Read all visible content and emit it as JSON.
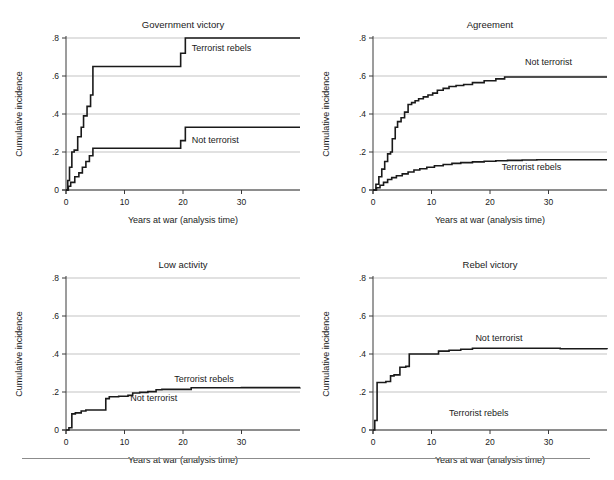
{
  "figure": {
    "background_color": "#ffffff",
    "line_color": "#1a1a1a",
    "grid_color": "#9a9a9a",
    "footer_rule": true
  },
  "chart_data": [
    {
      "type": "line",
      "title": "Government victory",
      "xlabel": "Years at war (analysis time)",
      "ylabel": "Cumulative incidence",
      "xlim": [
        0,
        40
      ],
      "ylim": [
        0,
        0.8
      ],
      "xticks": [
        0,
        10,
        20,
        30
      ],
      "xticklabels": [
        "0",
        "10",
        "20",
        "30"
      ],
      "yticks": [
        0,
        0.2,
        0.4,
        0.6,
        0.8
      ],
      "yticklabels": [
        "0",
        ".2",
        ".4",
        ".6",
        ".8"
      ],
      "grid": true,
      "step": true,
      "legend_position": "inline-annotations",
      "series": [
        {
          "name": "Terrorist rebels",
          "label_x": 21.5,
          "label_y": 0.73,
          "x": [
            0,
            0.3,
            0.6,
            1.0,
            1.4,
            2.0,
            2.6,
            3.0,
            3.6,
            4.2,
            4.6,
            18.6,
            19.6,
            20.4,
            40
          ],
          "y": [
            0,
            0.05,
            0.12,
            0.2,
            0.21,
            0.28,
            0.33,
            0.39,
            0.44,
            0.5,
            0.65,
            0.65,
            0.72,
            0.8,
            0.8
          ]
        },
        {
          "name": "Not terrorist",
          "label_x": 21.5,
          "label_y": 0.25,
          "x": [
            0,
            0.4,
            0.8,
            1.5,
            2.2,
            2.8,
            3.4,
            4.0,
            4.6,
            18.6,
            19.6,
            20.4,
            40
          ],
          "y": [
            0,
            0.02,
            0.04,
            0.07,
            0.09,
            0.12,
            0.15,
            0.18,
            0.22,
            0.22,
            0.26,
            0.33,
            0.33
          ]
        }
      ]
    },
    {
      "type": "line",
      "title": "Agreement",
      "xlabel": "Years at war (analysis time)",
      "ylabel": "Cumulative incidence",
      "xlim": [
        0,
        40
      ],
      "ylim": [
        0,
        0.8
      ],
      "xticks": [
        0,
        10,
        20,
        30
      ],
      "xticklabels": [
        "0",
        "10",
        "20",
        "30"
      ],
      "yticks": [
        0,
        0.2,
        0.4,
        0.6,
        0.8
      ],
      "yticklabels": [
        "0",
        ".2",
        ".4",
        ".6",
        ".8"
      ],
      "grid": true,
      "step": true,
      "legend_position": "inline-annotations",
      "series": [
        {
          "name": "Not terrorist",
          "label_x": 26.0,
          "label_y": 0.66,
          "x": [
            0,
            0.5,
            1.0,
            1.5,
            2.0,
            2.5,
            3.0,
            3.3,
            3.8,
            4.2,
            4.8,
            5.4,
            6.0,
            6.6,
            7.2,
            7.8,
            8.6,
            9.4,
            10.2,
            11.0,
            12.0,
            13.0,
            14.2,
            15.5,
            17.0,
            19.0,
            21.0,
            22.5,
            40
          ],
          "y": [
            0,
            0.03,
            0.07,
            0.11,
            0.15,
            0.19,
            0.2,
            0.27,
            0.33,
            0.36,
            0.38,
            0.41,
            0.45,
            0.46,
            0.47,
            0.48,
            0.49,
            0.5,
            0.51,
            0.525,
            0.535,
            0.545,
            0.55,
            0.555,
            0.565,
            0.575,
            0.585,
            0.595,
            0.595
          ]
        },
        {
          "name": "Terrorist rebels",
          "label_x": 22.0,
          "label_y": 0.105,
          "x": [
            0,
            0.6,
            1.2,
            1.8,
            2.5,
            3.2,
            4.0,
            5.0,
            6.0,
            7.0,
            8.0,
            9.2,
            10.5,
            12.0,
            13.5,
            15.0,
            17.0,
            19.0,
            21.0,
            23.0,
            25.5,
            28.0,
            40
          ],
          "y": [
            0,
            0.012,
            0.025,
            0.04,
            0.055,
            0.065,
            0.075,
            0.085,
            0.095,
            0.105,
            0.112,
            0.12,
            0.128,
            0.134,
            0.14,
            0.144,
            0.148,
            0.151,
            0.154,
            0.156,
            0.158,
            0.159,
            0.159
          ]
        }
      ]
    },
    {
      "type": "line",
      "title": "Low activity",
      "xlabel": "Years at war (analysis time)",
      "ylabel": "Cumulative incidence",
      "xlim": [
        0,
        40
      ],
      "ylim": [
        0,
        0.8
      ],
      "xticks": [
        0,
        10,
        20,
        30
      ],
      "xticklabels": [
        "0",
        "10",
        "20",
        "30"
      ],
      "yticks": [
        0,
        0.2,
        0.4,
        0.6,
        0.8
      ],
      "yticklabels": [
        "0",
        ".2",
        ".4",
        ".6",
        ".8"
      ],
      "grid": true,
      "step": true,
      "legend_position": "inline-annotations",
      "series": [
        {
          "name": "Terrorist rebels",
          "label_x": 18.5,
          "label_y": 0.255,
          "x": [
            0,
            0.5,
            1.0,
            1.6,
            2.6,
            3.4,
            6.2,
            6.8,
            7.4,
            9.0,
            10.6,
            11.4,
            12.6,
            14.0,
            15.4,
            16.4,
            20.6,
            21.4,
            24.0,
            30.0,
            40
          ],
          "y": [
            0,
            0.012,
            0.085,
            0.09,
            0.1,
            0.105,
            0.105,
            0.165,
            0.175,
            0.178,
            0.182,
            0.195,
            0.198,
            0.202,
            0.212,
            0.214,
            0.214,
            0.222,
            0.222,
            0.223,
            0.224
          ]
        },
        {
          "name": "Not terrorist",
          "label_x": 11.0,
          "label_y": 0.155,
          "x": [],
          "y": []
        }
      ]
    },
    {
      "type": "line",
      "title": "Rebel victory",
      "xlabel": "Years at war (analysis time)",
      "ylabel": "Cumulative incidence",
      "xlim": [
        0,
        40
      ],
      "ylim": [
        0,
        0.8
      ],
      "xticks": [
        0,
        10,
        20,
        30
      ],
      "xticklabels": [
        "0",
        "10",
        "20",
        "30"
      ],
      "yticks": [
        0,
        0.2,
        0.4,
        0.6,
        0.8
      ],
      "yticklabels": [
        "0",
        ".2",
        ".4",
        ".6",
        ".8"
      ],
      "grid": true,
      "step": true,
      "legend_position": "inline-annotations",
      "series": [
        {
          "name": "Not terrorist",
          "label_x": 17.5,
          "label_y": 0.47,
          "x": [
            0,
            0.3,
            0.7,
            2.2,
            3.0,
            3.6,
            4.6,
            5.6,
            6.2,
            10.4,
            11.2,
            13.0,
            15.0,
            17.0,
            24.0,
            32.0,
            40
          ],
          "y": [
            0,
            0.05,
            0.25,
            0.255,
            0.285,
            0.29,
            0.33,
            0.335,
            0.4,
            0.4,
            0.415,
            0.42,
            0.425,
            0.43,
            0.43,
            0.428,
            0.425
          ]
        },
        {
          "name": "Terrorist rebels",
          "label_x": 13.0,
          "label_y": 0.075,
          "x": [],
          "y": []
        }
      ]
    }
  ]
}
